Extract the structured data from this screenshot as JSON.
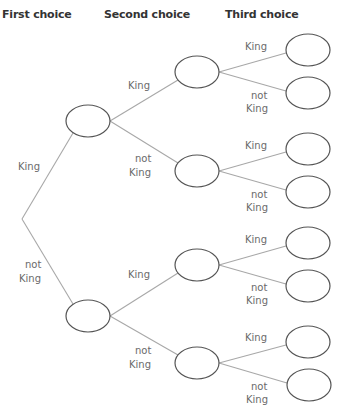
{
  "headers": {
    "first": "First choice",
    "second": "Second choice",
    "third": "Third choice"
  },
  "labels": {
    "king": "King",
    "not": "not",
    "not_king": "not King"
  },
  "tree": {
    "root": {
      "x": 22,
      "y": 219
    },
    "level1": [
      {
        "label": "King",
        "x": 88,
        "y": 121
      },
      {
        "label": "not King",
        "x": 88,
        "y": 316
      }
    ],
    "level2": [
      {
        "parent": 0,
        "label": "King",
        "x": 197,
        "y": 72
      },
      {
        "parent": 0,
        "label": "not King",
        "x": 197,
        "y": 171
      },
      {
        "parent": 1,
        "label": "King",
        "x": 197,
        "y": 265
      },
      {
        "parent": 1,
        "label": "not King",
        "x": 197,
        "y": 363
      }
    ],
    "level3": [
      {
        "parent": 0,
        "label": "King",
        "x": 308,
        "y": 50
      },
      {
        "parent": 0,
        "label": "not King",
        "x": 308,
        "y": 93
      },
      {
        "parent": 1,
        "label": "King",
        "x": 308,
        "y": 149
      },
      {
        "parent": 1,
        "label": "not King",
        "x": 308,
        "y": 192
      },
      {
        "parent": 2,
        "label": "King",
        "x": 308,
        "y": 243
      },
      {
        "parent": 2,
        "label": "not King",
        "x": 308,
        "y": 286
      },
      {
        "parent": 3,
        "label": "King",
        "x": 308,
        "y": 342
      },
      {
        "parent": 3,
        "label": "not King",
        "x": 309,
        "y": 385
      }
    ]
  },
  "colors": {
    "branch": "#a8a8a8",
    "node_stroke": "#555555",
    "label": "#6a6a6a",
    "header": "#333333"
  }
}
